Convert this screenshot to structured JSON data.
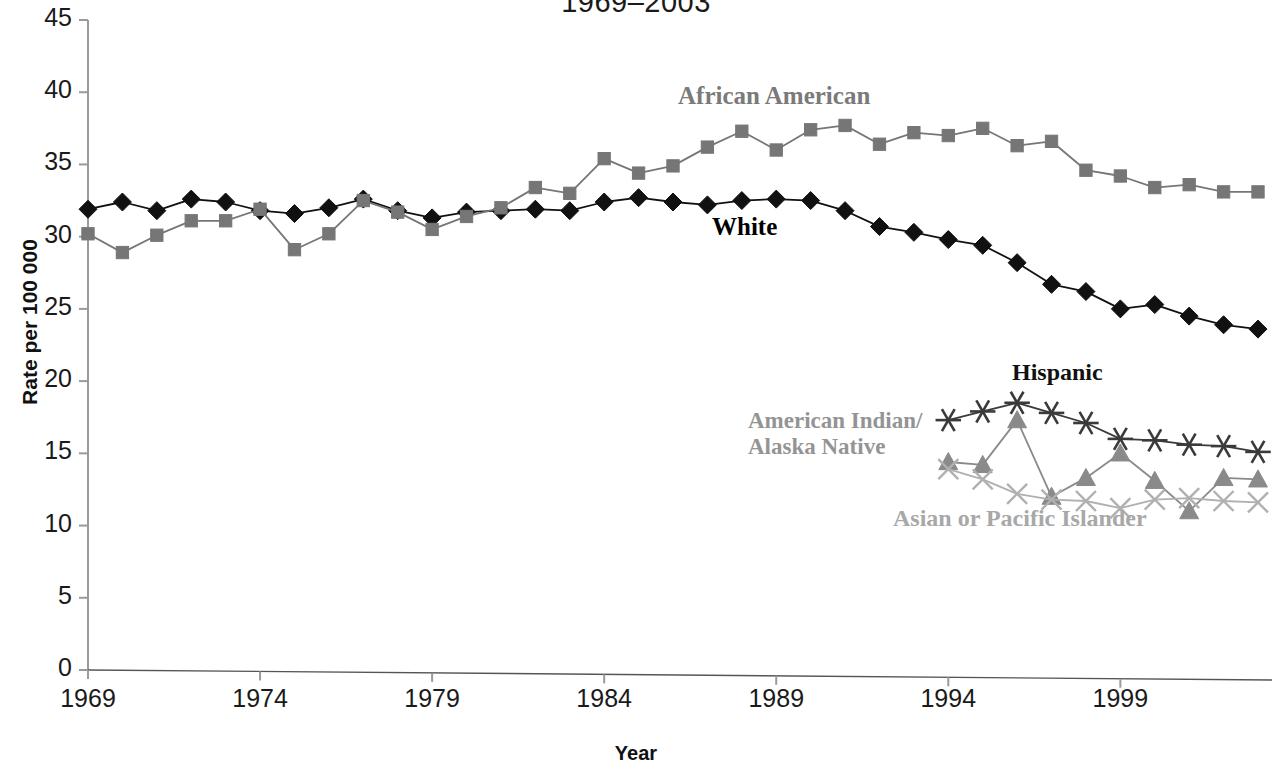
{
  "chart_data": {
    "type": "line",
    "title": "1969–2003",
    "xlabel": "Year",
    "ylabel": "Rate per 100 000",
    "xlim": [
      1969,
      2003
    ],
    "ylim": [
      0,
      45
    ],
    "ytick_labels": [
      "0",
      "5",
      "10",
      "15",
      "20",
      "25",
      "30",
      "35",
      "40",
      "45"
    ],
    "ytick_values": [
      0,
      5,
      10,
      15,
      20,
      25,
      30,
      35,
      40,
      45
    ],
    "xtick_labels": [
      "1969",
      "1974",
      "1979",
      "1984",
      "1989",
      "1994",
      "1999"
    ],
    "xtick_values": [
      1969,
      1974,
      1979,
      1984,
      1989,
      1994,
      1999
    ],
    "grid": false,
    "legend_position": "inline-annotations",
    "series": [
      {
        "name": "White",
        "label": "White",
        "color": "#111111",
        "marker": "diamond",
        "x": [
          1969,
          1970,
          1971,
          1972,
          1973,
          1974,
          1975,
          1976,
          1977,
          1978,
          1979,
          1980,
          1981,
          1982,
          1983,
          1984,
          1985,
          1986,
          1987,
          1988,
          1989,
          1990,
          1991,
          1992,
          1993,
          1994,
          1995,
          1996,
          1997,
          1998,
          1999,
          2000,
          2001,
          2002,
          2003
        ],
        "values": [
          31.9,
          32.4,
          31.8,
          32.6,
          32.4,
          31.8,
          31.6,
          32.0,
          32.6,
          31.8,
          31.3,
          31.7,
          31.8,
          31.9,
          31.8,
          32.4,
          32.7,
          32.4,
          32.2,
          32.5,
          32.6,
          32.5,
          31.8,
          30.7,
          30.3,
          29.8,
          29.4,
          28.2,
          26.7,
          26.2,
          25.0,
          25.3,
          24.5,
          23.9,
          23.6
        ]
      },
      {
        "name": "African American",
        "label": "African American",
        "color": "#767676",
        "marker": "square",
        "x": [
          1969,
          1970,
          1971,
          1972,
          1973,
          1974,
          1975,
          1976,
          1977,
          1978,
          1979,
          1980,
          1981,
          1982,
          1983,
          1984,
          1985,
          1986,
          1987,
          1988,
          1989,
          1990,
          1991,
          1992,
          1993,
          1994,
          1995,
          1996,
          1997,
          1998,
          1999,
          2000,
          2001,
          2002,
          2003
        ],
        "values": [
          30.2,
          28.9,
          30.1,
          31.1,
          31.1,
          31.9,
          29.1,
          30.2,
          32.5,
          31.7,
          30.5,
          31.4,
          32.0,
          33.4,
          33.0,
          35.4,
          34.4,
          34.9,
          36.2,
          37.3,
          36.0,
          37.4,
          37.7,
          36.4,
          37.2,
          37.0,
          37.5,
          36.3,
          36.6,
          34.6,
          34.2,
          33.4,
          33.6,
          33.1,
          33.1
        ]
      },
      {
        "name": "Hispanic",
        "label": "Hispanic",
        "color": "#3a3a3a",
        "marker": "asterisk",
        "x": [
          1994,
          1995,
          1996,
          1997,
          1998,
          1999,
          2000,
          2001,
          2002,
          2003
        ],
        "values": [
          17.3,
          17.9,
          18.5,
          17.8,
          17.1,
          16.0,
          15.9,
          15.6,
          15.5,
          15.1
        ]
      },
      {
        "name": "American Indian/Alaska Native",
        "label": "American Indian/\nAlaska Native",
        "color": "#8a8a8a",
        "marker": "triangle",
        "x": [
          1994,
          1995,
          1996,
          1997,
          1998,
          1999,
          2000,
          2001,
          2002,
          2003
        ],
        "values": [
          14.4,
          14.2,
          17.3,
          12.0,
          13.3,
          15.0,
          13.1,
          11.0,
          13.3,
          13.2
        ]
      },
      {
        "name": "Asian or Pacific Islander",
        "label": "Asian or Pacific Islander",
        "color": "#b0b0b0",
        "marker": "x",
        "x": [
          1994,
          1995,
          1996,
          1997,
          1998,
          1999,
          2000,
          2001,
          2002,
          2003
        ],
        "values": [
          13.9,
          13.2,
          12.2,
          11.8,
          11.7,
          11.2,
          11.8,
          11.9,
          11.7,
          11.6
        ]
      }
    ]
  },
  "annotations": {
    "white": "White",
    "african_american": "African American",
    "hispanic": "Hispanic",
    "american_indian_line1": "American Indian/",
    "american_indian_line2": "Alaska Native",
    "asian_pacific": "Asian or Pacific Islander"
  },
  "axes": {
    "y_title": "Rate per 100 000",
    "x_title": "Year"
  },
  "colors": {
    "white_series": "#111111",
    "african_american_series": "#767676",
    "hispanic_series": "#3a3a3a",
    "aian_series": "#8a8a8a",
    "api_series": "#b0b0b0",
    "axis": "#9a9a9a",
    "text": "#1a1a1a"
  }
}
